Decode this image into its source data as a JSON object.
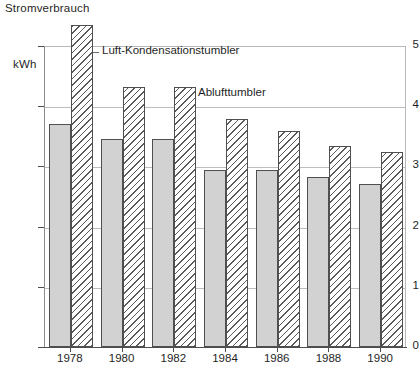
{
  "chart": {
    "title": "Stromverbrauch",
    "unit_label": "kWh",
    "annotations": {
      "series1": "Luft-Kondensationstumbler",
      "series2": "Ablufttumbler"
    }
  },
  "chart_data": {
    "type": "bar",
    "title": "Stromverbrauch",
    "xlabel": "",
    "ylabel": "kWh",
    "ylim": [
      0,
      5.5
    ],
    "yticks": [
      "0",
      "1",
      "2",
      "3",
      "4",
      "5"
    ],
    "ytick_values": [
      0,
      1,
      2,
      3,
      4,
      5
    ],
    "grid": true,
    "legend": "annotations-inline",
    "categories": [
      "1978",
      "1980",
      "1982",
      "1984",
      "1986",
      "1988",
      "1990"
    ],
    "series": [
      {
        "name": "Ablufttumbler",
        "style": "solid-gray",
        "values": [
          3.7,
          3.46,
          3.45,
          2.94,
          2.94,
          2.82,
          2.7
        ]
      },
      {
        "name": "Luft-Kondensationstumbler",
        "style": "hatched",
        "values": [
          5.35,
          4.32,
          4.32,
          3.79,
          3.58,
          3.34,
          3.24
        ]
      }
    ]
  }
}
